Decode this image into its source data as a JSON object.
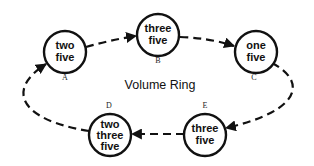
{
  "diagram": {
    "title": "Volume Ring",
    "nodes": [
      {
        "id": "A",
        "label": "A",
        "lines": [
          "two",
          "five"
        ]
      },
      {
        "id": "B",
        "label": "B",
        "lines": [
          "three",
          "five"
        ]
      },
      {
        "id": "C",
        "label": "C",
        "lines": [
          "one",
          "five"
        ]
      },
      {
        "id": "D",
        "label": "D",
        "lines": [
          "two",
          "three",
          "five"
        ]
      },
      {
        "id": "E",
        "label": "E",
        "lines": [
          "three",
          "five"
        ]
      }
    ],
    "edges": [
      {
        "from": "A",
        "to": "B",
        "style": "dashed"
      },
      {
        "from": "B",
        "to": "C",
        "style": "dashed"
      },
      {
        "from": "C",
        "to": "E",
        "style": "dashed"
      },
      {
        "from": "E",
        "to": "D",
        "style": "dashed"
      },
      {
        "from": "D",
        "to": "A",
        "style": "dashed"
      }
    ],
    "colors": {
      "stroke": "#111111",
      "background": "#ffffff"
    }
  }
}
